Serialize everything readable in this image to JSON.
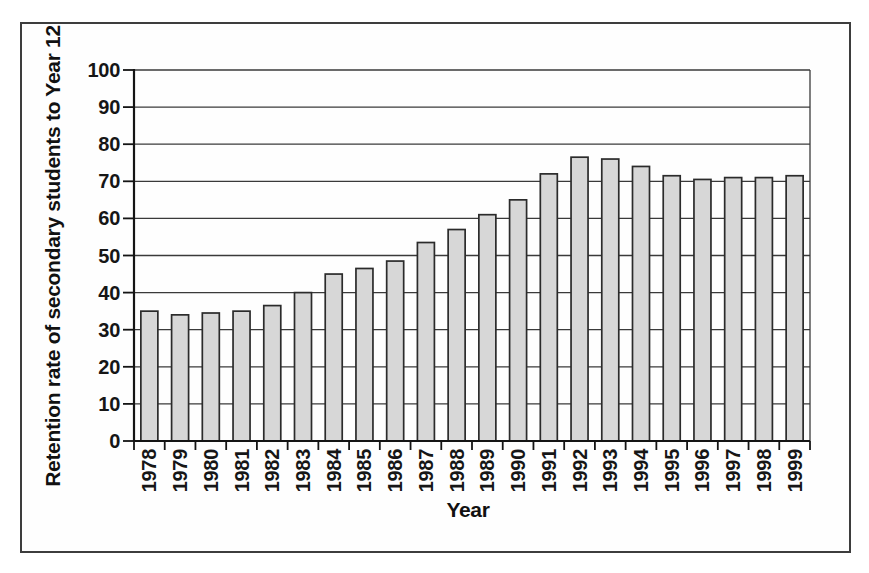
{
  "figure": {
    "background_color": "#ffffff",
    "frame_border_color": "#3d3d3d"
  },
  "chart_data": {
    "type": "bar",
    "title": "",
    "xlabel": "Year",
    "ylabel": "Retention rate of secondary students to Year 12",
    "categories": [
      "1978",
      "1979",
      "1980",
      "1981",
      "1982",
      "1983",
      "1984",
      "1985",
      "1986",
      "1987",
      "1988",
      "1989",
      "1990",
      "1991",
      "1992",
      "1993",
      "1994",
      "1995",
      "1996",
      "1997",
      "1998",
      "1999"
    ],
    "values": [
      35,
      34,
      34.5,
      35,
      36.5,
      40,
      45,
      46.5,
      48.5,
      53.5,
      57,
      61,
      65,
      72,
      76.5,
      76,
      74,
      71.5,
      70.5,
      71,
      71,
      71.5
    ],
    "ylim": [
      0,
      100
    ],
    "yticks": [
      0,
      10,
      20,
      30,
      40,
      50,
      60,
      70,
      80,
      90,
      100
    ],
    "grid": "horizontal",
    "legend_position": "none",
    "bar_fill": "#d7d7d7",
    "bar_stroke": "#2b2b2b",
    "grid_color": "#3a3a3a",
    "axis_color": "#141414"
  }
}
